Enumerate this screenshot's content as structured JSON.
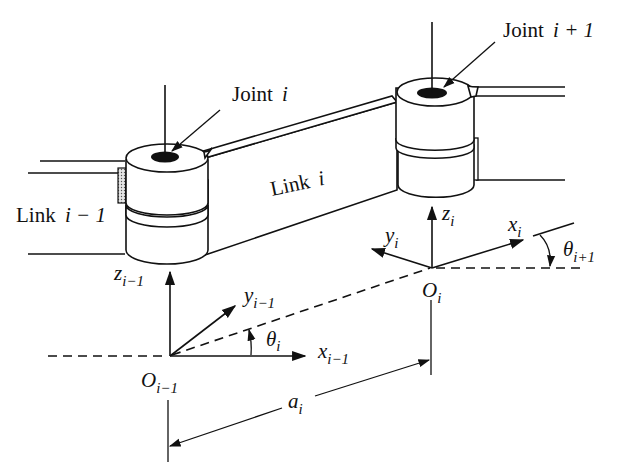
{
  "diagram": {
    "labels": {
      "joint_i": {
        "word": "Joint",
        "index": "i"
      },
      "joint_i_plus_1": {
        "word": "Joint",
        "index": "i + 1"
      },
      "link_i": {
        "word": "Link",
        "index": "i"
      },
      "link_i_minus_1": {
        "word": "Link",
        "index": "i − 1"
      },
      "z_prev": {
        "symbol": "z",
        "sub": "i−1"
      },
      "y_prev": {
        "symbol": "y",
        "sub": "i−1"
      },
      "x_prev": {
        "symbol": "x",
        "sub": "i−1"
      },
      "o_prev": {
        "symbol": "O",
        "sub": "i−1"
      },
      "theta_i": {
        "symbol": "θ",
        "sub": "i"
      },
      "z_i": {
        "symbol": "z",
        "sub": "i"
      },
      "y_i": {
        "symbol": "y",
        "sub": "i"
      },
      "x_i": {
        "symbol": "x",
        "sub": "i"
      },
      "o_i": {
        "symbol": "O",
        "sub": "i"
      },
      "theta_i_plus_1": {
        "symbol": "θ",
        "sub": "i+1"
      },
      "a_i": {
        "symbol": "a",
        "sub": "i"
      }
    }
  }
}
